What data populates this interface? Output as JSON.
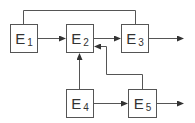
{
  "diagram": {
    "type": "block-diagram",
    "colors": {
      "stroke": "#555555",
      "text": "#333333",
      "background": "#ffffff"
    },
    "nodes": [
      {
        "id": "E1",
        "letter": "E",
        "sub": "1",
        "x": 10,
        "y": 24,
        "w": 28,
        "h": 29
      },
      {
        "id": "E2",
        "letter": "E",
        "sub": "2",
        "x": 66,
        "y": 24,
        "w": 28,
        "h": 29
      },
      {
        "id": "E3",
        "letter": "E",
        "sub": "3",
        "x": 121,
        "y": 24,
        "w": 28,
        "h": 29
      },
      {
        "id": "E4",
        "letter": "E",
        "sub": "4",
        "x": 66,
        "y": 89,
        "w": 28,
        "h": 29
      },
      {
        "id": "E5",
        "letter": "E",
        "sub": "5",
        "x": 128,
        "y": 89,
        "w": 29,
        "h": 29
      }
    ],
    "edges": [
      {
        "from": "E1",
        "to": "E3",
        "route": "top-bus",
        "arrow": false
      },
      {
        "from": "E1",
        "to": "E2",
        "arrow": true
      },
      {
        "from": "E2",
        "to": "E3",
        "arrow": true
      },
      {
        "from": "E3",
        "to": "output",
        "arrow": true
      },
      {
        "from": "E4",
        "to": "E2",
        "arrow": true
      },
      {
        "from": "E4",
        "to": "E5",
        "arrow": true
      },
      {
        "from": "E5",
        "to": "E2",
        "route": "feedback",
        "arrow": true
      },
      {
        "from": "E5",
        "to": "output",
        "arrow": true
      }
    ]
  }
}
